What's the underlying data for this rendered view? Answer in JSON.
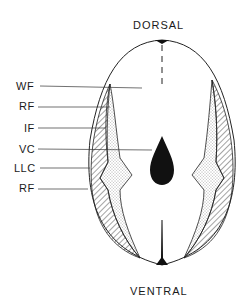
{
  "diagram": {
    "top_label": "DORSAL",
    "bottom_label": "VENTRAL",
    "labels": [
      {
        "id": "wf",
        "text": "WF"
      },
      {
        "id": "rf1",
        "text": "RF"
      },
      {
        "id": "if",
        "text": "IF"
      },
      {
        "id": "vc",
        "text": "VC"
      },
      {
        "id": "llc",
        "text": "LLC"
      },
      {
        "id": "rf2",
        "text": "RF"
      }
    ]
  }
}
